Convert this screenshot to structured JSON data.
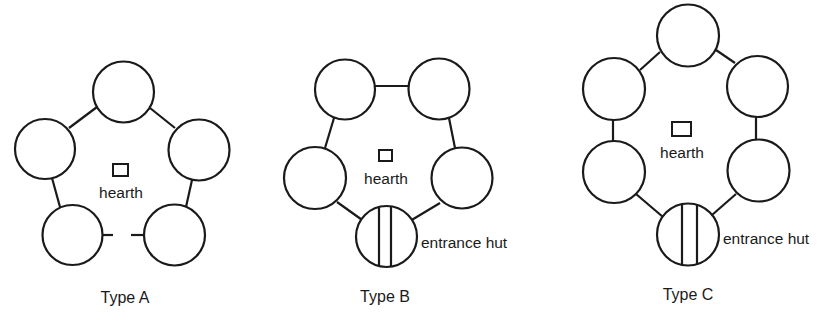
{
  "figure": {
    "stroke_color": "#1a1a1a",
    "background": "#ffffff"
  },
  "layouts": [
    {
      "id": "type-a",
      "caption": "Type A",
      "caption_pos": [
        125,
        303
      ],
      "hearth_label": "hearth",
      "hearth_box": [
        113,
        164,
        15,
        12
      ],
      "hearth_label_pos": [
        121,
        198
      ],
      "huts": [
        {
          "cx": 123.5,
          "cy": 92,
          "r": 30.5
        },
        {
          "cx": 45,
          "cy": 149,
          "r": 30
        },
        {
          "cx": 199,
          "cy": 150,
          "r": 30.5
        },
        {
          "cx": 72.5,
          "cy": 235,
          "r": 30
        },
        {
          "cx": 174.5,
          "cy": 235,
          "r": 30.5
        }
      ],
      "links": [
        [
          97,
          107,
          69,
          128
        ],
        [
          150,
          108,
          175,
          128
        ],
        [
          52,
          178,
          60,
          207
        ],
        [
          192,
          180,
          186,
          207
        ],
        [
          102,
          235,
          113,
          235
        ],
        [
          131,
          235,
          144,
          235
        ]
      ],
      "entrance": null
    },
    {
      "id": "type-b",
      "caption": "Type B",
      "caption_pos": [
        385,
        302
      ],
      "hearth_label": "hearth",
      "hearth_box": [
        379,
        150,
        13,
        11
      ],
      "hearth_label_pos": [
        386,
        184
      ],
      "huts": [
        {
          "cx": 345,
          "cy": 89.5,
          "r": 30
        },
        {
          "cx": 439,
          "cy": 89,
          "r": 30.5
        },
        {
          "cx": 315,
          "cy": 178,
          "r": 31
        },
        {
          "cx": 462,
          "cy": 178,
          "r": 30.5
        }
      ],
      "links": [
        [
          375,
          86,
          409,
          86
        ],
        [
          334,
          118,
          325,
          148
        ],
        [
          449,
          118,
          455,
          148
        ],
        [
          337,
          202,
          365,
          222
        ],
        [
          440,
          203,
          410,
          221
        ]
      ],
      "entrance": {
        "cx": 386.5,
        "cy": 236.5,
        "r": 30.5,
        "bars_x": [
          379,
          391
        ],
        "label": "entrance hut",
        "label_pos": [
          421,
          248
        ]
      }
    },
    {
      "id": "type-c",
      "caption": "Type C",
      "caption_pos": [
        688,
        300
      ],
      "hearth_label": "hearth",
      "hearth_box": [
        672,
        122,
        19,
        14
      ],
      "hearth_label_pos": [
        682,
        158
      ],
      "huts": [
        {
          "cx": 688,
          "cy": 35.5,
          "r": 31
        },
        {
          "cx": 614,
          "cy": 89,
          "r": 31
        },
        {
          "cx": 757.5,
          "cy": 86.5,
          "r": 30.5
        },
        {
          "cx": 614,
          "cy": 172,
          "r": 31
        },
        {
          "cx": 758.5,
          "cy": 170.5,
          "r": 31
        }
      ],
      "links": [
        [
          660,
          52,
          640,
          70
        ],
        [
          716,
          50,
          735,
          63
        ],
        [
          613,
          120,
          613,
          141
        ],
        [
          756,
          117,
          756,
          139
        ],
        [
          636,
          194,
          663,
          217
        ],
        [
          736,
          194,
          712,
          215
        ]
      ],
      "entrance": {
        "cx": 688,
        "cy": 234.5,
        "r": 31,
        "bars_x": [
          682,
          697
        ],
        "label": "entrance hut",
        "label_pos": [
          723,
          244
        ]
      }
    }
  ]
}
